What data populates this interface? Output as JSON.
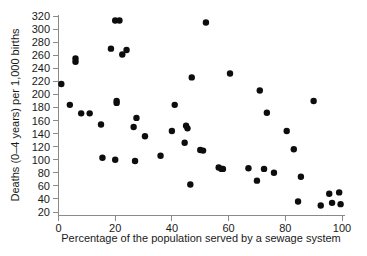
{
  "chart_data": {
    "type": "scatter",
    "title": "",
    "xlabel": "Percentage of the population served by a sewage system",
    "ylabel": "Deaths (0–4 years) per 1,000 births",
    "xlim": [
      0,
      100
    ],
    "ylim": [
      15,
      325
    ],
    "grid": false,
    "legend": null,
    "xticks": [
      0,
      20,
      40,
      60,
      80,
      100
    ],
    "yticks": [
      20,
      40,
      60,
      80,
      100,
      120,
      140,
      160,
      180,
      200,
      220,
      240,
      260,
      280,
      300,
      320
    ],
    "xtick_labels": [
      "0",
      "20",
      "40",
      "60",
      "80",
      "100"
    ],
    "ytick_labels": [
      "20",
      "40",
      "60",
      "80",
      "100",
      "120",
      "140",
      "160",
      "180",
      "200",
      "220",
      "240",
      "260",
      "280",
      "300",
      "320"
    ],
    "marker": "filled-circle",
    "marker_color": "#0d0d0d",
    "marker_size": 3.2,
    "points": [
      {
        "x": 1.0,
        "y": 216
      },
      {
        "x": 4.0,
        "y": 184
      },
      {
        "x": 6.0,
        "y": 250
      },
      {
        "x": 6.0,
        "y": 255
      },
      {
        "x": 8.0,
        "y": 171
      },
      {
        "x": 11.0,
        "y": 171
      },
      {
        "x": 15.0,
        "y": 154
      },
      {
        "x": 15.5,
        "y": 103
      },
      {
        "x": 18.5,
        "y": 270
      },
      {
        "x": 20.0,
        "y": 100
      },
      {
        "x": 20.5,
        "y": 187
      },
      {
        "x": 20.5,
        "y": 190
      },
      {
        "x": 20.0,
        "y": 313
      },
      {
        "x": 21.5,
        "y": 313
      },
      {
        "x": 22.5,
        "y": 261
      },
      {
        "x": 24.0,
        "y": 268
      },
      {
        "x": 26.5,
        "y": 150
      },
      {
        "x": 27.0,
        "y": 98
      },
      {
        "x": 27.5,
        "y": 164
      },
      {
        "x": 30.5,
        "y": 136
      },
      {
        "x": 36.0,
        "y": 106
      },
      {
        "x": 40.0,
        "y": 144
      },
      {
        "x": 41.0,
        "y": 184
      },
      {
        "x": 44.5,
        "y": 126
      },
      {
        "x": 45.0,
        "y": 152
      },
      {
        "x": 45.5,
        "y": 148
      },
      {
        "x": 46.5,
        "y": 62
      },
      {
        "x": 47.0,
        "y": 226
      },
      {
        "x": 50.0,
        "y": 115
      },
      {
        "x": 51.0,
        "y": 114
      },
      {
        "x": 52.0,
        "y": 310
      },
      {
        "x": 56.5,
        "y": 88
      },
      {
        "x": 57.5,
        "y": 86
      },
      {
        "x": 58.0,
        "y": 86
      },
      {
        "x": 60.5,
        "y": 232
      },
      {
        "x": 67.0,
        "y": 87
      },
      {
        "x": 70.0,
        "y": 68
      },
      {
        "x": 71.0,
        "y": 206
      },
      {
        "x": 72.5,
        "y": 86
      },
      {
        "x": 73.5,
        "y": 172
      },
      {
        "x": 76.0,
        "y": 80
      },
      {
        "x": 80.5,
        "y": 144
      },
      {
        "x": 83.0,
        "y": 116
      },
      {
        "x": 84.5,
        "y": 36
      },
      {
        "x": 85.5,
        "y": 74
      },
      {
        "x": 90.0,
        "y": 190
      },
      {
        "x": 92.5,
        "y": 30
      },
      {
        "x": 95.5,
        "y": 48
      },
      {
        "x": 96.5,
        "y": 34
      },
      {
        "x": 99.0,
        "y": 50
      },
      {
        "x": 99.5,
        "y": 32
      }
    ]
  },
  "axes": {
    "x_axis_label": "Percentage of the population served by a sewage system",
    "y_axis_label": "Deaths (0–4 years) per 1,000 births"
  }
}
